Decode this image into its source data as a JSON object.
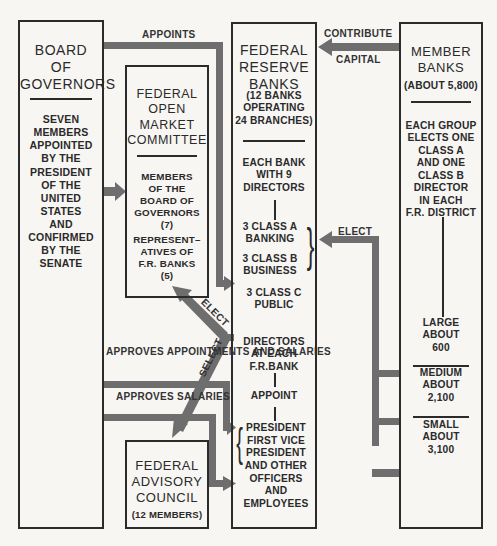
{
  "colors": {
    "arrow": "#6e6e6e",
    "border": "#2b2b2b",
    "background": "#f7f6f3",
    "text": "#2a2a2a"
  },
  "board": {
    "title": "BOARD\nOF\nGOVERNORS",
    "description": "SEVEN\nMEMBERS\nAPPOINTED\nBY THE\nPRESIDENT\nOF THE\nUNITED\nSTATES\nAND\nCONFIRMED\nBY THE\nSENATE"
  },
  "fomc": {
    "title": "FEDERAL\nOPEN\nMARKET\nCOMMITTEE",
    "members": "MEMBERS\nOF THE\nBOARD OF\nGOVERNORS\n(7)",
    "representatives": "REPRESENT–\nATIVES  OF\nF.R. BANKS\n(5)"
  },
  "frb": {
    "title": "FEDERAL\nRESERVE\nBANKS",
    "subtitle": "(12 BANKS\nOPERATING\n24 BRANCHES)",
    "each_bank": "EACH BANK\nWITH 9\nDIRECTORS",
    "class_a": "3 CLASS A\nBANKING",
    "class_b": "3 CLASS B\nBUSINESS",
    "class_c": "3 CLASS C\nPUBLIC",
    "directors": "DIRECTORS\nAT EACH\nF.R.BANK",
    "appoint": "APPOINT",
    "officers": "PRESIDENT\nFIRST VICE\nPRESIDENT\nAND OTHER\nOFFICERS\nAND\nEMPLOYEES"
  },
  "member": {
    "title": "MEMBER\nBANKS",
    "subtitle": "(ABOUT 5,800)",
    "each_group": "EACH GROUP\nELECTS ONE\nCLASS A\nAND ONE\nCLASS B\nDIRECTOR\nIN EACH\nF.R. DISTRICT",
    "large": "LARGE\nABOUT\n600",
    "medium": "MEDIUM\nABOUT\n2,100",
    "small": "SMALL\nABOUT\n3,100"
  },
  "advisory": {
    "title": "FEDERAL\nADVISORY\nCOUNCIL",
    "subtitle": "(12 MEMBERS)"
  },
  "arrows": {
    "appoints": "APPOINTS",
    "contribute": "CONTRIBUTE",
    "capital": "CAPITAL",
    "elect_member": "ELECT",
    "elect_fomc": "ELECT",
    "select": "SELECT",
    "approves_appointments": "APPROVES\nAPPOINTMENTS\nAND SALARIES",
    "approves_salaries": "APPROVES\nSALARIES"
  }
}
